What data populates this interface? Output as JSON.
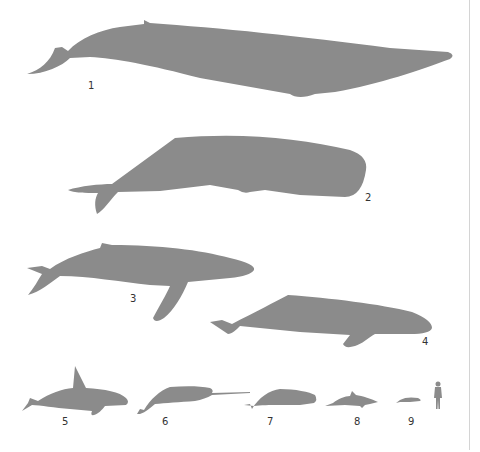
{
  "figure": {
    "silhouette_color": "#8b8b8b",
    "label_color": "#333333",
    "divider_color": "#d4d4d4",
    "labels": [
      {
        "id": 1,
        "text": "1"
      },
      {
        "id": 2,
        "text": "2"
      },
      {
        "id": 3,
        "text": "3"
      },
      {
        "id": 4,
        "text": "4"
      },
      {
        "id": 5,
        "text": "5"
      },
      {
        "id": 6,
        "text": "6"
      },
      {
        "id": 7,
        "text": "7"
      },
      {
        "id": 8,
        "text": "8"
      },
      {
        "id": 9,
        "text": "9"
      }
    ],
    "icons": [
      "blue-whale-silhouette",
      "sperm-whale-silhouette",
      "humpback-whale-silhouette",
      "right-whale-silhouette",
      "orca-silhouette",
      "narwhal-silhouette",
      "beluga-silhouette",
      "dolphin-silhouette",
      "porpoise-silhouette",
      "human-silhouette"
    ]
  }
}
